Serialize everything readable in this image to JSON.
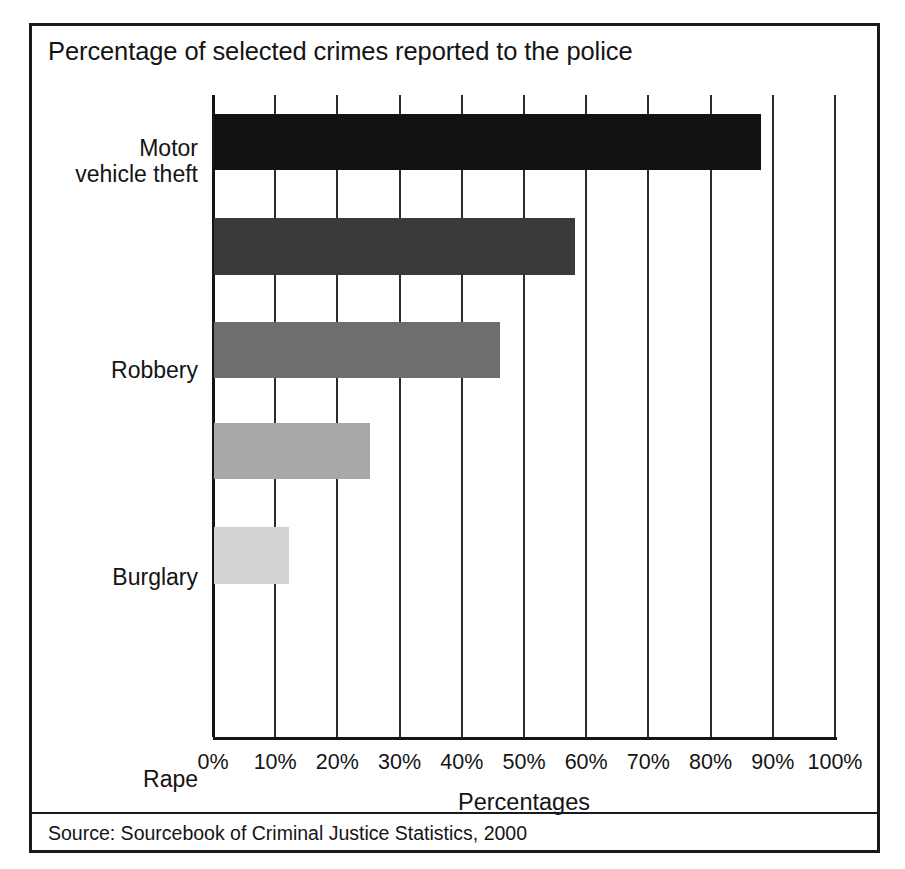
{
  "figure": {
    "title": "Percentage of selected crimes reported to the police",
    "source": "Source: Sourcebook of Criminal Justice Statistics, 2000"
  },
  "colors": {
    "frame": "#1a1a1a",
    "text": "#141414",
    "gridline": "#2b2b2b",
    "axis": "#151515",
    "background": "#ffffff"
  },
  "chart_data": {
    "type": "bar",
    "orientation": "horizontal",
    "title": "Percentage of selected crimes reported to the police",
    "xlabel": "Percentages",
    "ylabel": "",
    "xlim": [
      0,
      100
    ],
    "grid": true,
    "legend": false,
    "categories": [
      "Motor\nvehicle theft",
      "Robbery",
      "Burglary",
      "Rape",
      "Theft less\nthan $50"
    ],
    "values": [
      88,
      58,
      46,
      25,
      12
    ],
    "bar_colors": [
      "#111111",
      "#3a3a3a",
      "#6e6e6e",
      "#a8a8a8",
      "#d2d2d2"
    ],
    "xticks": [
      0,
      10,
      20,
      30,
      40,
      50,
      60,
      70,
      80,
      90,
      100
    ],
    "xticklabels": [
      "0%",
      "10%",
      "20%",
      "30%",
      "40%",
      "50%",
      "60%",
      "70%",
      "80%",
      "90%",
      "100%"
    ],
    "source": "Source: Sourcebook of Criminal Justice Statistics, 2000"
  },
  "geometry": {
    "bars_px": [
      {
        "top": 19,
        "height": 56
      },
      {
        "top": 123,
        "height": 57
      },
      {
        "top": 227,
        "height": 56
      },
      {
        "top": 328,
        "height": 56
      },
      {
        "top": 432,
        "height": 57
      },
      {
        "top": 541,
        "height": 76
      }
    ]
  }
}
